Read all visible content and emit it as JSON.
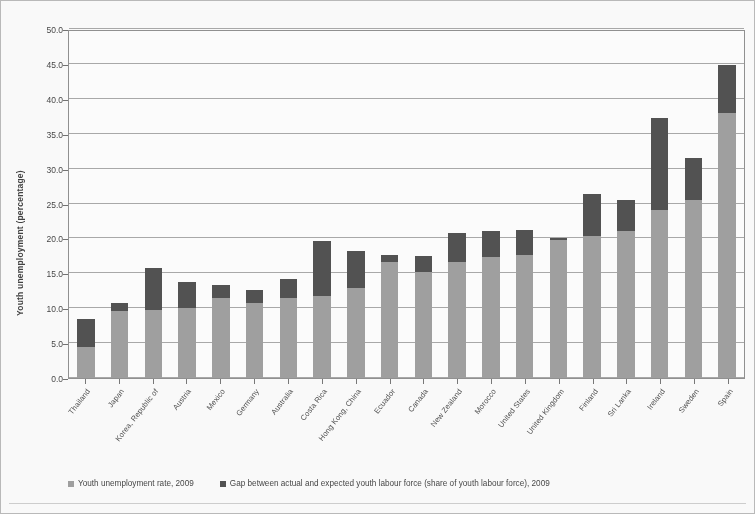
{
  "chart": {
    "ylabel": "Youth unemployment (percentage)",
    "legend": {
      "series1": "Youth unemployment rate, 2009",
      "series2": "Gap between actual and expected youth labour force (share of youth labour force), 2009"
    },
    "colors": {
      "series1": "#9e9e9e",
      "series2": "#4d4d4d",
      "gridline": "#a8a8a8",
      "frame": "#8e8e8e"
    }
  },
  "chart_data": {
    "type": "bar",
    "stacked": true,
    "title": "",
    "xlabel": "",
    "ylabel": "Youth unemployment (percentage)",
    "ylim": [
      0,
      50
    ],
    "ytick_labels": [
      "0.0",
      "5.0",
      "10.0",
      "15.0",
      "20.0",
      "25.0",
      "30.0",
      "35.0",
      "40.0",
      "45.0",
      "50.0"
    ],
    "yticks": [
      0,
      5,
      10,
      15,
      20,
      25,
      30,
      35,
      40,
      45,
      50
    ],
    "grid": true,
    "legend_position": "bottom-left",
    "categories": [
      "Thailand",
      "Japan",
      "Korea, Republic of",
      "Austria",
      "Mexico",
      "Germany",
      "Australia",
      "Costa Rica",
      "Hong Kong, China",
      "Ecuador",
      "Canada",
      "New Zealand",
      "Morocco",
      "United States",
      "United Kingdom",
      "Finland",
      "Sri Lanka",
      "Ireland",
      "Sweden",
      "Spain"
    ],
    "series": [
      {
        "name": "Youth unemployment rate, 2009",
        "color": "#9e9e9e",
        "values": [
          4.5,
          9.6,
          9.8,
          10.0,
          11.5,
          10.8,
          11.4,
          11.8,
          12.9,
          16.6,
          15.2,
          16.6,
          17.3,
          17.6,
          19.8,
          20.3,
          21.1,
          24.0,
          25.5,
          38.0
        ]
      },
      {
        "name": "Gap between actual and expected youth labour force (share of youth labour force), 2009",
        "color": "#4d4d4d",
        "values": [
          4.0,
          1.1,
          5.9,
          3.8,
          1.8,
          1.8,
          2.8,
          7.8,
          5.3,
          1.0,
          2.3,
          4.2,
          3.8,
          3.6,
          0.2,
          6.0,
          4.4,
          13.3,
          6.0,
          6.8
        ]
      }
    ],
    "totals": [
      8.5,
      10.7,
      15.7,
      13.8,
      13.3,
      12.6,
      14.2,
      19.6,
      18.2,
      17.6,
      17.5,
      20.8,
      21.1,
      21.2,
      20.0,
      26.3,
      25.5,
      37.3,
      31.5,
      44.8
    ]
  }
}
